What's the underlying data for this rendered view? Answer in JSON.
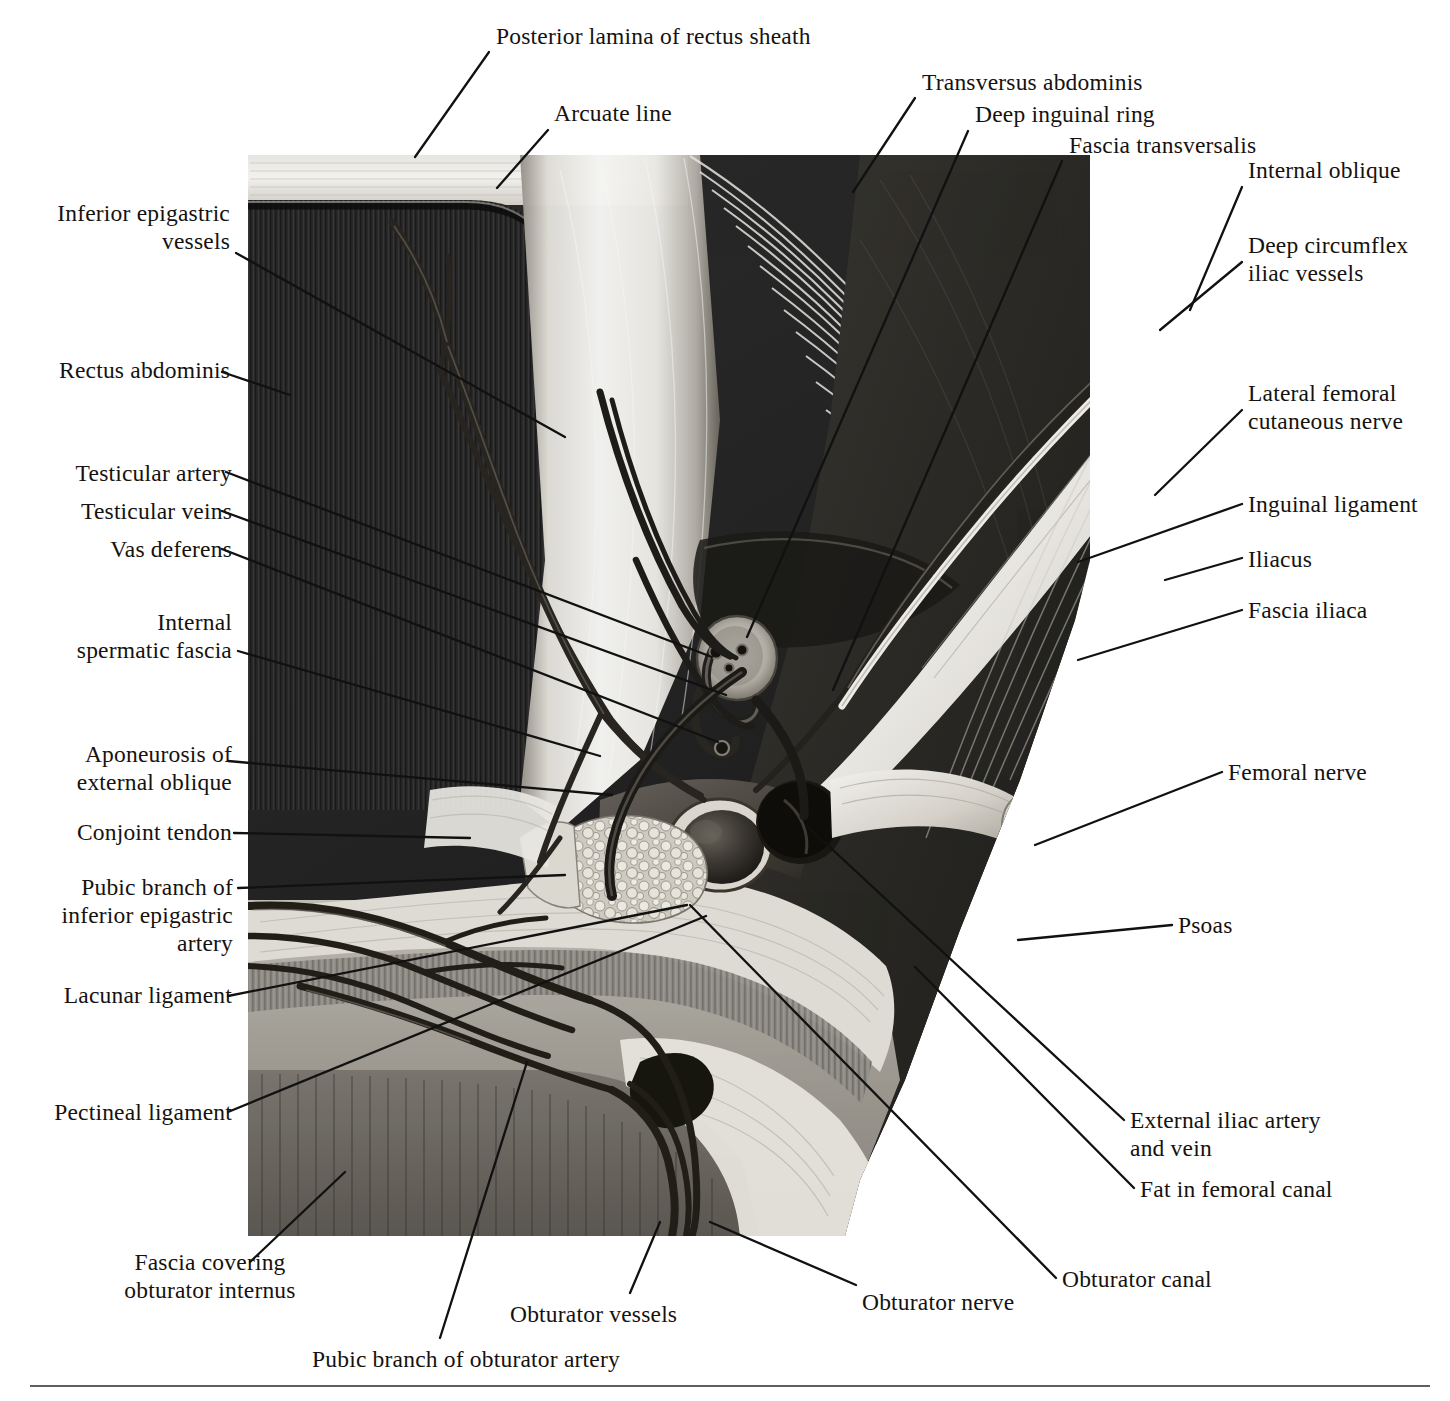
{
  "figure": {
    "type": "anatomical-illustration",
    "artist_signature": "ld",
    "style": "grayscale halftone airbrush plate",
    "image_box": {
      "left": 248,
      "top": 155,
      "right": 1090,
      "bottom": 1236
    }
  },
  "labels": [
    {
      "id": "posterior-lamina-of-rectus-sheath",
      "text": "Posterior lamina of rectus sheath",
      "align": "left",
      "x": 496,
      "y": 22,
      "leader": [
        [
          489,
          52
        ],
        [
          415,
          157
        ]
      ]
    },
    {
      "id": "arcuate-line",
      "text": "Arcuate line",
      "align": "left",
      "x": 554,
      "y": 99,
      "leader": [
        [
          548,
          130
        ],
        [
          497,
          188
        ]
      ]
    },
    {
      "id": "transversus-abdominis",
      "text": "Transversus abdominis",
      "align": "left",
      "x": 922,
      "y": 68,
      "leader": [
        [
          915,
          98
        ],
        [
          853,
          192
        ]
      ]
    },
    {
      "id": "deep-inguinal-ring",
      "text": "Deep inguinal ring",
      "align": "left",
      "x": 975,
      "y": 100,
      "leader": [
        [
          968,
          131
        ],
        [
          747,
          637
        ]
      ]
    },
    {
      "id": "fascia-transversalis",
      "text": "Fascia transversalis",
      "align": "left",
      "x": 1069,
      "y": 131,
      "leader": [
        [
          1062,
          161
        ],
        [
          833,
          690
        ]
      ]
    },
    {
      "id": "internal-oblique",
      "text": "Internal oblique",
      "align": "left",
      "x": 1248,
      "y": 156,
      "leader": [
        [
          1242,
          187
        ],
        [
          1190,
          310
        ]
      ]
    },
    {
      "id": "deep-circumflex-iliac-vessels",
      "text": "Deep circumflex\niliac vessels",
      "align": "left",
      "x": 1248,
      "y": 231,
      "leader": [
        [
          1242,
          262
        ],
        [
          1160,
          330
        ]
      ]
    },
    {
      "id": "inferior-epigastric-vessels",
      "text": "Inferior epigastric\nvessels",
      "align": "right",
      "x": 20,
      "y": 199,
      "w": 210,
      "leader": [
        [
          236,
          253
        ],
        [
          565,
          437
        ]
      ]
    },
    {
      "id": "rectus-abdominis",
      "text": "Rectus abdominis",
      "align": "right",
      "x": 20,
      "y": 356,
      "w": 210,
      "leader": [
        [
          222,
          372
        ],
        [
          290,
          395
        ]
      ]
    },
    {
      "id": "lateral-femoral-cutaneous-nerve",
      "text": "Lateral femoral\ncutaneous nerve",
      "align": "left",
      "x": 1248,
      "y": 379,
      "leader": [
        [
          1242,
          410
        ],
        [
          1155,
          495
        ]
      ]
    },
    {
      "id": "testicular-artery",
      "text": "Testicular artery",
      "align": "right",
      "x": 20,
      "y": 459,
      "w": 212,
      "leader": [
        [
          226,
          472
        ],
        [
          712,
          657
        ]
      ]
    },
    {
      "id": "inguinal-ligament",
      "text": "Inguinal ligament",
      "align": "left",
      "x": 1248,
      "y": 490,
      "leader": [
        [
          1242,
          504
        ],
        [
          1078,
          562
        ]
      ]
    },
    {
      "id": "testicular-veins",
      "text": "Testicular veins",
      "align": "right",
      "x": 20,
      "y": 497,
      "w": 212,
      "leader": [
        [
          222,
          511
        ],
        [
          726,
          695
        ]
      ]
    },
    {
      "id": "iliacus",
      "text": "Iliacus",
      "align": "left",
      "x": 1248,
      "y": 545,
      "leader": [
        [
          1242,
          558
        ],
        [
          1165,
          580
        ]
      ]
    },
    {
      "id": "vas-deferens",
      "text": "Vas deferens",
      "align": "right",
      "x": 20,
      "y": 535,
      "w": 212,
      "leader": [
        [
          222,
          549
        ],
        [
          718,
          742
        ]
      ]
    },
    {
      "id": "fascia-iliaca",
      "text": "Fascia iliaca",
      "align": "left",
      "x": 1248,
      "y": 596,
      "leader": [
        [
          1242,
          610
        ],
        [
          1078,
          660
        ]
      ]
    },
    {
      "id": "internal-spermatic-fascia",
      "text": "Internal\nspermatic fascia",
      "align": "right",
      "x": 20,
      "y": 608,
      "w": 212,
      "leader": [
        [
          238,
          651
        ],
        [
          600,
          756
        ]
      ]
    },
    {
      "id": "aponeurosis-of-external-oblique",
      "text": "Aponeurosis of\nexternal oblique",
      "align": "right",
      "x": 20,
      "y": 740,
      "w": 212,
      "leader": [
        [
          228,
          761
        ],
        [
          612,
          795
        ]
      ]
    },
    {
      "id": "femoral-nerve",
      "text": "Femoral nerve",
      "align": "left",
      "x": 1228,
      "y": 758,
      "leader": [
        [
          1222,
          772
        ],
        [
          1035,
          845
        ]
      ]
    },
    {
      "id": "conjoint-tendon",
      "text": "Conjoint tendon",
      "align": "right",
      "x": 20,
      "y": 818,
      "w": 212,
      "leader": [
        [
          234,
          833
        ],
        [
          470,
          838
        ]
      ]
    },
    {
      "id": "pubic-branch-of-inferior-epigastric-artery",
      "text": "Pubic branch of\ninferior epigastric\nartery",
      "align": "right",
      "x": 18,
      "y": 873,
      "w": 215,
      "leader": [
        [
          238,
          888
        ],
        [
          565,
          875
        ]
      ]
    },
    {
      "id": "psoas",
      "text": "Psoas",
      "align": "left",
      "x": 1178,
      "y": 911,
      "leader": [
        [
          1172,
          925
        ],
        [
          1018,
          940
        ]
      ]
    },
    {
      "id": "lacunar-ligament",
      "text": "Lacunar ligament",
      "align": "right",
      "x": 20,
      "y": 981,
      "w": 212,
      "leader": [
        [
          228,
          996
        ],
        [
          687,
          905
        ]
      ]
    },
    {
      "id": "pectineal-ligament",
      "text": "Pectineal ligament",
      "align": "right",
      "x": 20,
      "y": 1098,
      "w": 212,
      "leader": [
        [
          228,
          1112
        ],
        [
          706,
          916
        ]
      ]
    },
    {
      "id": "external-iliac-artery-and-vein",
      "text": "External iliac artery\nand vein",
      "align": "left",
      "x": 1130,
      "y": 1106,
      "leader": [
        [
          1124,
          1120
        ],
        [
          806,
          825
        ]
      ]
    },
    {
      "id": "fat-in-femoral-canal",
      "text": "Fat in femoral canal",
      "align": "left",
      "x": 1140,
      "y": 1175,
      "leader": [
        [
          1134,
          1188
        ],
        [
          915,
          967
        ]
      ]
    },
    {
      "id": "obturator-canal",
      "text": "Obturator canal",
      "align": "left",
      "x": 1062,
      "y": 1265,
      "leader": [
        [
          1056,
          1278
        ],
        [
          690,
          905
        ]
      ]
    },
    {
      "id": "fascia-covering-obturator-internus",
      "text": "Fascia covering\nobturator internus",
      "align": "center",
      "x": 80,
      "y": 1248,
      "w": 260,
      "leader": [
        [
          250,
          1262
        ],
        [
          345,
          1172
        ]
      ]
    },
    {
      "id": "obturator-nerve",
      "text": "Obturator nerve",
      "align": "left",
      "x": 862,
      "y": 1288,
      "leader": [
        [
          856,
          1285
        ],
        [
          710,
          1222
        ]
      ]
    },
    {
      "id": "obturator-vessels",
      "text": "Obturator vessels",
      "align": "left",
      "x": 510,
      "y": 1300,
      "leader": [
        [
          630,
          1293
        ],
        [
          660,
          1222
        ]
      ]
    },
    {
      "id": "pubic-branch-of-obturator-artery",
      "text": "Pubic branch of obturator artery",
      "align": "left",
      "x": 312,
      "y": 1345,
      "leader": [
        [
          440,
          1338
        ],
        [
          527,
          1062
        ]
      ]
    }
  ],
  "divider": {
    "present": true
  }
}
